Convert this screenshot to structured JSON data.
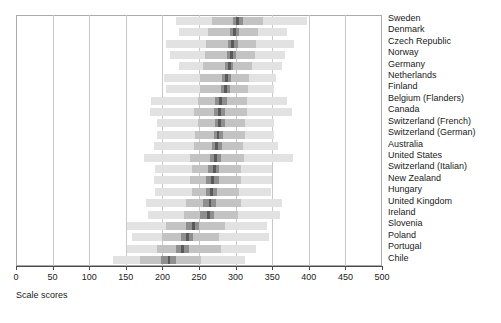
{
  "chart_data": {
    "type": "bar",
    "title": "",
    "subtitle": "",
    "xlabel": "Scale scores",
    "ylabel": "",
    "xlim": [
      0,
      500
    ],
    "xticks": [
      0,
      50,
      100,
      150,
      200,
      250,
      300,
      350,
      400,
      450,
      500
    ],
    "xtick_labels": [
      "0",
      "50",
      "100",
      "150",
      "200",
      "250",
      "300",
      "350",
      "400",
      "450",
      "500"
    ],
    "grid": true,
    "grid_axis": "x",
    "legend": "none",
    "orientation": "horizontal",
    "band_levels": [
      "p5_p95",
      "p25_p75",
      "core",
      "mean"
    ],
    "band_colors": {
      "p5_p95": "#e2e2e2",
      "p25_p75": "#c3c3c3",
      "core": "#8f8f8f",
      "mean": "#5a5a5a"
    },
    "categories": [
      "Sweden",
      "Denmark",
      "Czech Republic",
      "Norway",
      "Germany",
      "Netherlands",
      "Finland",
      "Belgium (Flanders)",
      "Canada",
      "Switzerland (French)",
      "Switzerland (German)",
      "Australia",
      "United States",
      "Switzerland (Italian)",
      "New Zealand",
      "Hungary",
      "United Kingdom",
      "Ireland",
      "Slovenia",
      "Poland",
      "Portugal",
      "Chile"
    ],
    "series": [
      {
        "name": "5th percentile",
        "values": [
          218,
          222,
          205,
          210,
          222,
          202,
          205,
          185,
          183,
          193,
          193,
          188,
          175,
          190,
          188,
          190,
          178,
          180,
          152,
          158,
          152,
          132
        ]
      },
      {
        "name": "25th percentile",
        "values": [
          268,
          262,
          260,
          258,
          255,
          252,
          252,
          248,
          243,
          248,
          245,
          243,
          238,
          240,
          238,
          240,
          232,
          230,
          205,
          200,
          192,
          170
        ]
      },
      {
        "name": "core lower",
        "values": [
          297,
          292,
          290,
          288,
          285,
          282,
          280,
          272,
          270,
          272,
          270,
          268,
          265,
          262,
          260,
          260,
          255,
          252,
          232,
          225,
          218,
          198
        ]
      },
      {
        "name": "mean",
        "values": [
          303,
          298,
          296,
          294,
          292,
          288,
          286,
          280,
          278,
          278,
          276,
          274,
          273,
          271,
          269,
          267,
          265,
          263,
          242,
          234,
          227,
          209
        ]
      },
      {
        "name": "core upper",
        "values": [
          310,
          304,
          303,
          300,
          297,
          294,
          292,
          288,
          286,
          285,
          283,
          281,
          280,
          278,
          277,
          275,
          273,
          271,
          250,
          242,
          236,
          218
        ]
      },
      {
        "name": "75th percentile",
        "values": [
          337,
          330,
          328,
          326,
          322,
          318,
          317,
          315,
          315,
          313,
          313,
          310,
          312,
          308,
          308,
          305,
          307,
          303,
          285,
          277,
          280,
          253
        ]
      },
      {
        "name": "95th percentile",
        "values": [
          397,
          370,
          380,
          368,
          363,
          355,
          352,
          370,
          377,
          352,
          352,
          358,
          378,
          350,
          350,
          348,
          363,
          360,
          343,
          345,
          328,
          313
        ]
      }
    ]
  },
  "axis": {
    "xlabel_text": "Scale scores"
  }
}
